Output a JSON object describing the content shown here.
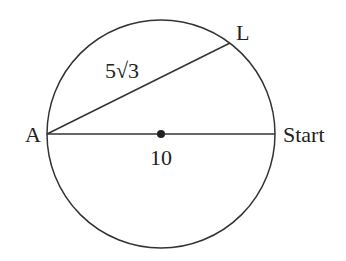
{
  "diagram": {
    "circle": {
      "cx": 161,
      "cy": 134,
      "r": 114,
      "stroke": "#333333"
    },
    "center_dot": {
      "cx": 161,
      "cy": 134,
      "r": 4,
      "fill": "#222222"
    },
    "points": {
      "A": {
        "label": "A",
        "x": 47,
        "y": 134
      },
      "L": {
        "label": "L",
        "x": 230,
        "y": 43
      },
      "Start": {
        "label": "Start",
        "x": 275,
        "y": 134
      }
    },
    "segments": {
      "chord_AL": {
        "label": "5√3"
      },
      "diameter_A_Start": {
        "label": "10"
      }
    }
  }
}
